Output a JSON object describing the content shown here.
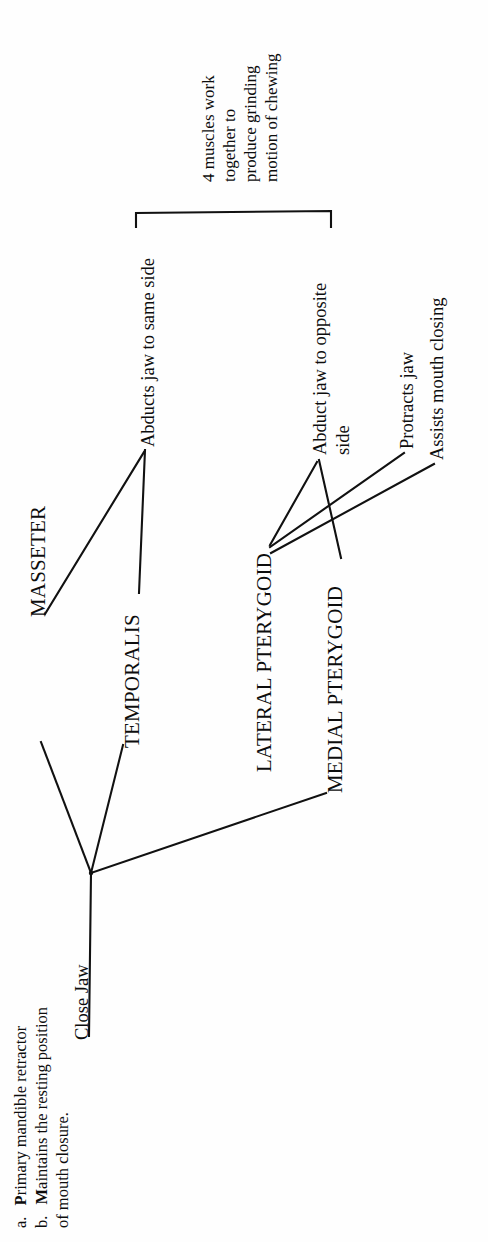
{
  "document": {
    "title": "Muscles of Mastication concept map",
    "orientation": "rotated-90-counterclockwise",
    "background_color": "#fefefe",
    "ink_color": "#111111"
  },
  "diagram": {
    "type": "concept-map",
    "central_node": {
      "label": "Close Jaw",
      "id": "close-jaw"
    },
    "muscles": [
      {
        "id": "masseter",
        "label": "MASSETER"
      },
      {
        "id": "temporalis",
        "label": "TEMPORALIS"
      },
      {
        "id": "lateral-pterygoid",
        "label": "LATERAL PTERYGOID"
      },
      {
        "id": "medial-pterygoid",
        "label": "MEDIAL PTERYGOID"
      }
    ],
    "actions": [
      {
        "id": "abducts-same-side",
        "label": "Abducts jaw to same side"
      },
      {
        "id": "abduct-opposite-side-line1",
        "label": "Abduct jaw to opposite"
      },
      {
        "id": "abduct-opposite-side-line2",
        "label": "side"
      },
      {
        "id": "protracts-jaw",
        "label": "Protracts jaw"
      },
      {
        "id": "assists-mouth-closing",
        "label": "Assists mouth closing"
      }
    ],
    "bracket_note": {
      "lines": [
        "4 muscles work",
        "together to",
        "produce grinding",
        "motion of chewing"
      ]
    },
    "footnotes": [
      {
        "marker": "a.",
        "strong": "P",
        "rest": "rimary mandible retractor"
      },
      {
        "marker": "b.",
        "strong": "M",
        "rest": "aintains the resting position"
      },
      {
        "marker": "",
        "strong": "",
        "rest": "of mouth closure."
      }
    ],
    "edges": [
      {
        "from": "close-jaw-hub",
        "to": "masseter"
      },
      {
        "from": "close-jaw-hub",
        "to": "temporalis"
      },
      {
        "from": "close-jaw-hub",
        "to": "medial-pterygoid"
      },
      {
        "from": "close-jaw-hub",
        "to": "close-jaw-label"
      },
      {
        "from": "masseter",
        "to": "abducts-same-side"
      },
      {
        "from": "temporalis",
        "to": "abducts-same-side"
      },
      {
        "from": "lateral-pterygoid",
        "to": "abduct-opposite-side"
      },
      {
        "from": "medial-pterygoid",
        "to": "abduct-opposite-side"
      },
      {
        "from": "lateral-pterygoid",
        "to": "protracts-jaw"
      },
      {
        "from": "lateral-pterygoid",
        "to": "assists-mouth-closing"
      }
    ]
  }
}
